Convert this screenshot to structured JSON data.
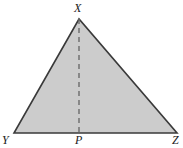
{
  "figure": {
    "kind": "geometry-diagram",
    "background_color": "#ffffff",
    "fill_color": "#cccccc",
    "stroke_color": "#3a3a3a",
    "dash_color": "#6b6b6b",
    "stroke_width": 1.6,
    "dash_width": 1.4,
    "dash_pattern": "5 4"
  },
  "triangle": {
    "name": "triangle-XYZ",
    "vertices": [
      {
        "label": "X",
        "role": "apex",
        "x": 79,
        "y": 19
      },
      {
        "label": "Y",
        "role": "base-left",
        "x": 14,
        "y": 133
      },
      {
        "label": "Z",
        "role": "base-right",
        "x": 177,
        "y": 133
      }
    ],
    "points_path": "79,19 14,133 177,133"
  },
  "altitude": {
    "name": "altitude-XP",
    "from_label": "X",
    "to_label": "P",
    "x1": 79,
    "y1": 19,
    "x2": 79,
    "y2": 133,
    "style": "dashed"
  },
  "labels": {
    "apex": "X",
    "base_left": "Y",
    "foot": "P",
    "base_right": "Z"
  }
}
